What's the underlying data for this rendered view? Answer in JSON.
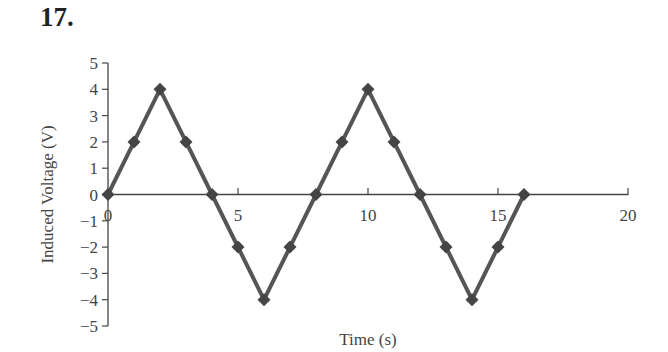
{
  "problem_number": "17.",
  "chart_data": {
    "type": "line",
    "title": "",
    "xlabel": "Time (s)",
    "ylabel": "Induced Voltage (V)",
    "xlim": [
      0,
      20
    ],
    "ylim": [
      -5,
      5
    ],
    "x_ticks": [
      0,
      5,
      10,
      15,
      20
    ],
    "y_ticks": [
      5,
      4,
      3,
      2,
      1,
      0,
      -1,
      -2,
      -3,
      -4,
      -5
    ],
    "x_tick_labels": [
      "0",
      "5",
      "10",
      "15",
      "20"
    ],
    "y_tick_labels": [
      "5",
      "4",
      "3",
      "2",
      "1",
      "0",
      "−1",
      "−2",
      "−3",
      "−4",
      "−5"
    ],
    "grid": false,
    "legend": null,
    "marker": "diamond",
    "line_color": "#555555",
    "marker_color": "#444444",
    "series": [
      {
        "name": "Induced Voltage",
        "x": [
          0,
          1,
          2,
          3,
          4,
          5,
          6,
          7,
          8,
          9,
          10,
          11,
          12,
          13,
          14,
          15,
          16
        ],
        "values": [
          0,
          2,
          4,
          2,
          0,
          -2,
          -4,
          -2,
          0,
          2,
          4,
          2,
          0,
          -2,
          -4,
          -2,
          0
        ]
      }
    ]
  }
}
